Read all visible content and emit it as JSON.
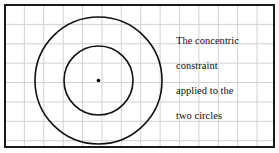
{
  "figure": {
    "name": "concentric-constraint-illustration",
    "background_color": "#ffffff",
    "border_color": "#1a1a1a",
    "grid_color": "#c9c9cf",
    "stroke_color": "#111111",
    "frame": {
      "x": 4,
      "y": 4,
      "width": 271,
      "height": 144,
      "border_width": 2
    },
    "grid": {
      "cell_size": 19.4,
      "visible": true
    }
  },
  "annotation": {
    "full_text": "The concentric constraint applied to the two circles",
    "lines": [
      "The concentric",
      "constraint",
      "applied to the",
      "two circles"
    ]
  },
  "shapes": {
    "outer_circle": {
      "label": "outer-circle",
      "cx": 92.5,
      "cy": 74.5,
      "r": 63.5,
      "stroke": "#111111",
      "stroke_width": 1.6,
      "fill": "none"
    },
    "inner_circle": {
      "label": "inner-circle",
      "cx": 92.5,
      "cy": 74.5,
      "r": 34.5,
      "stroke": "#111111",
      "stroke_width": 1.6,
      "fill": "none"
    },
    "center_point": {
      "label": "shared-center-point",
      "cx": 92.5,
      "cy": 74.5,
      "r": 1.8,
      "fill": "#000000"
    }
  }
}
